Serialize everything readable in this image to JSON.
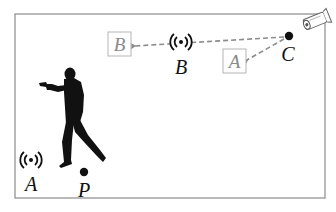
{
  "diagram": {
    "frame": {
      "x": 15,
      "y": 14,
      "width": 310,
      "height": 184,
      "stroke": "#8a8a8a"
    },
    "colors": {
      "ink": "#111111",
      "arrow": "#8c8c8c",
      "box_stroke": "#b5b5b5",
      "box_text": "#8a8a8a"
    },
    "labels": {
      "antenna_a": "A",
      "antenna_b": "B",
      "point_p": "P",
      "point_c": "C",
      "reflected_box_a": "A",
      "reflected_box_b": "B"
    },
    "nodes": [
      {
        "id": "antenna-a",
        "icon": "wifi-broadcast-icon",
        "x": 31,
        "y": 160,
        "label": "A"
      },
      {
        "id": "antenna-b",
        "icon": "wifi-broadcast-icon",
        "x": 181,
        "y": 42,
        "label": "B"
      },
      {
        "id": "point-p",
        "icon": "dot",
        "x": 84,
        "y": 172,
        "label": "P"
      },
      {
        "id": "point-c",
        "icon": "dot",
        "x": 287,
        "y": 37,
        "label": "C"
      },
      {
        "id": "camera",
        "icon": "security-camera-icon",
        "x": 311,
        "y": 25
      },
      {
        "id": "person",
        "icon": "gunman-silhouette-icon",
        "x": 72,
        "y": 118
      }
    ],
    "edges": [
      {
        "from": "point-c",
        "to": "box-b",
        "style": "dashed-arrow",
        "via": "antenna-b"
      },
      {
        "from": "point-c",
        "to": "box-a",
        "style": "dashed-arrow"
      }
    ]
  }
}
